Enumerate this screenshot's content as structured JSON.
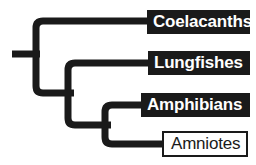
{
  "figure": {
    "kind": "cladogram",
    "background_color": "#ffffff",
    "branch_color": "#1a1a1a",
    "branch_width_px": 7
  },
  "taxa": [
    {
      "id": "coelacanths",
      "label": "Coelacanths",
      "style": "filled",
      "box_fill": "#1a1a1a",
      "text_color": "#ffffff",
      "tip_y": 21
    },
    {
      "id": "lungfishes",
      "label": "Lungfishes",
      "style": "filled",
      "box_fill": "#1a1a1a",
      "text_color": "#ffffff",
      "tip_y": 63
    },
    {
      "id": "amphibians",
      "label": "Amphibians",
      "style": "filled",
      "box_fill": "#1a1a1a",
      "text_color": "#ffffff",
      "tip_y": 105
    },
    {
      "id": "amniotes",
      "label": "Amniotes",
      "style": "outlined",
      "box_fill": "#ffffff",
      "text_color": "#1a1a1a",
      "tip_y": 144
    }
  ],
  "tree_topology": {
    "root_stem": {
      "x_start": 12,
      "x_end": 36,
      "y": 54
    },
    "nodes": [
      {
        "id": "node-1",
        "x": 36,
        "child_up_y": 21,
        "child_down_y": 93
      },
      {
        "id": "node-2",
        "x": 68,
        "child_up_y": 63,
        "child_down_y": 125
      },
      {
        "id": "node-3",
        "x": 105,
        "child_up_y": 105,
        "child_down_y": 144
      }
    ]
  }
}
